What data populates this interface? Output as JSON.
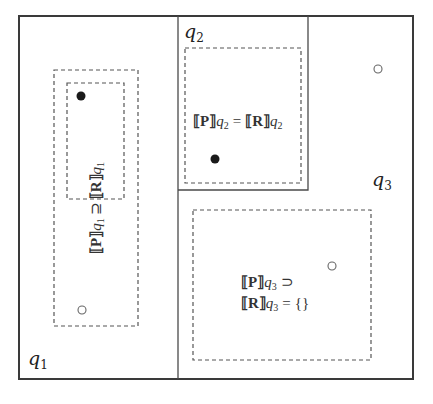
{
  "diagram": {
    "frame": {
      "x": 19,
      "y": 16,
      "w": 394,
      "h": 363
    },
    "regions": [
      {
        "id": "q1",
        "label_base": "q",
        "label_sub": "1"
      },
      {
        "id": "q2",
        "label_base": "q",
        "label_sub": "2"
      },
      {
        "id": "q3",
        "label_base": "q",
        "label_sub": "3"
      }
    ],
    "q1": {
      "relation": {
        "left_term": "⟦P⟧",
        "left_var": "q",
        "left_sub": "1",
        "operator": "⊇",
        "right_term": "⟦R⟧",
        "right_var": "q",
        "right_sub": "1"
      },
      "points": [
        {
          "type": "filled",
          "cx": 81,
          "cy": 96
        },
        {
          "type": "hollow",
          "cx": 82,
          "cy": 310
        }
      ]
    },
    "q2": {
      "relation": {
        "left_term": "⟦P⟧",
        "left_var": "q",
        "left_sub": "2",
        "operator": "=",
        "right_term": "⟦R⟧",
        "right_var": "q",
        "right_sub": "2"
      },
      "points": [
        {
          "type": "filled",
          "cx": 215,
          "cy": 159
        }
      ]
    },
    "q3": {
      "relation_line1": {
        "term": "⟦P⟧",
        "var": "q",
        "sub": "3",
        "operator": "⊃"
      },
      "relation_line2": {
        "term": "⟦R⟧",
        "var": "q",
        "sub": "3",
        "operator": "=",
        "value": "{}"
      },
      "points": [
        {
          "type": "hollow",
          "cx": 332,
          "cy": 266
        },
        {
          "type": "hollow",
          "cx": 378,
          "cy": 69
        }
      ]
    }
  }
}
